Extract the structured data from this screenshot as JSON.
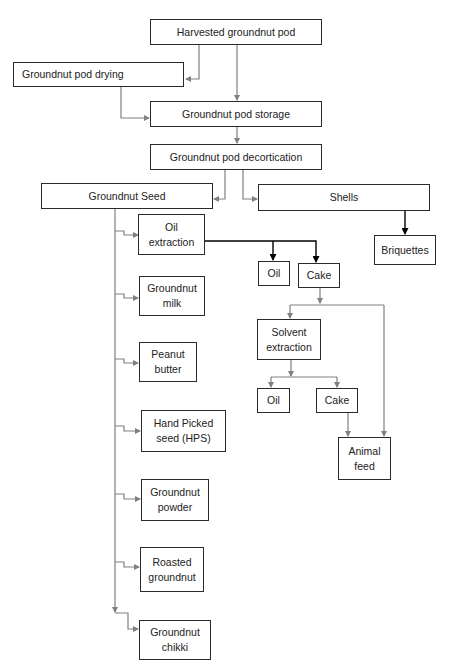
{
  "diagram": {
    "type": "flowchart",
    "title": "",
    "nodes": {
      "harvested": "Harvested groundnut pod",
      "drying": "Groundnut pod drying",
      "storage": "Groundnut pod storage",
      "decortication": "Groundnut pod decortication",
      "seed": "Groundnut Seed",
      "shells": "Shells",
      "briquettes": "Briquettes",
      "oil_extraction": "Oil extraction",
      "oil_1": "Oil",
      "cake_1": "Cake",
      "solvent_extraction": "Solvent extraction",
      "oil_2": "Oil",
      "cake_2": "Cake",
      "animal_feed": "Animal feed",
      "groundnut_milk": "Groundnut milk",
      "peanut_butter": "Peanut butter",
      "hps": "Hand Picked seed (HPS)",
      "groundnut_powder": "Groundnut powder",
      "roasted_groundnut": "Roasted groundnut",
      "groundnut_chikki": "Groundnut chikki"
    },
    "edges": [
      [
        "harvested",
        "drying"
      ],
      [
        "harvested",
        "storage"
      ],
      [
        "drying",
        "storage"
      ],
      [
        "storage",
        "decortication"
      ],
      [
        "decortication",
        "seed"
      ],
      [
        "decortication",
        "shells"
      ],
      [
        "shells",
        "briquettes"
      ],
      [
        "seed",
        "oil_extraction"
      ],
      [
        "seed",
        "groundnut_milk"
      ],
      [
        "seed",
        "peanut_butter"
      ],
      [
        "seed",
        "hps"
      ],
      [
        "seed",
        "groundnut_powder"
      ],
      [
        "seed",
        "roasted_groundnut"
      ],
      [
        "seed",
        "groundnut_chikki"
      ],
      [
        "oil_extraction",
        "oil_1"
      ],
      [
        "oil_extraction",
        "cake_1"
      ],
      [
        "cake_1",
        "solvent_extraction"
      ],
      [
        "cake_1",
        "animal_feed"
      ],
      [
        "solvent_extraction",
        "oil_2"
      ],
      [
        "solvent_extraction",
        "cake_2"
      ],
      [
        "cake_2",
        "animal_feed"
      ]
    ],
    "colors": {
      "box_border": "#2a2a2a",
      "connector_gray": "#808080",
      "connector_black": "#000000"
    }
  }
}
